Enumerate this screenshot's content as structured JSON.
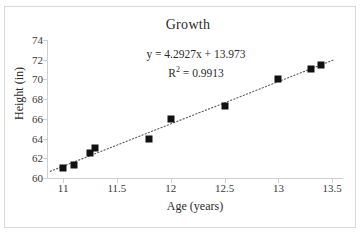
{
  "chart_data": {
    "type": "scatter",
    "title": "Growth",
    "xlabel": "Age (years)",
    "ylabel": "Height (in)",
    "xlim": [
      10.85,
      13.6
    ],
    "ylim": [
      60,
      74
    ],
    "xticks": [
      "11",
      "11.5",
      "12",
      "12.5",
      "13",
      "13.5"
    ],
    "xtick_values": [
      11,
      11.5,
      12,
      12.5,
      13,
      13.5
    ],
    "yticks": [
      "60",
      "62",
      "64",
      "66",
      "68",
      "70",
      "72",
      "74"
    ],
    "ytick_values": [
      60,
      62,
      64,
      66,
      68,
      70,
      72,
      74
    ],
    "grid": false,
    "legend": "none",
    "marker_color": "#111111",
    "trendline_color": "#5a5a5a",
    "trendline_style": "dotted",
    "x": [
      11,
      11.1,
      11.25,
      11.3,
      11.8,
      12,
      12.5,
      13,
      13.3,
      13.4
    ],
    "y": [
      61,
      61.3,
      62.5,
      63,
      64,
      66,
      67.3,
      70,
      71.1,
      71.5
    ],
    "points": [
      {
        "x": 11,
        "y": 61
      },
      {
        "x": 11.1,
        "y": 61.3
      },
      {
        "x": 11.25,
        "y": 62.5
      },
      {
        "x": 11.3,
        "y": 63
      },
      {
        "x": 11.8,
        "y": 64
      },
      {
        "x": 12,
        "y": 66
      },
      {
        "x": 12.5,
        "y": 67.3
      },
      {
        "x": 13,
        "y": 70
      },
      {
        "x": 13.3,
        "y": 71.1
      },
      {
        "x": 13.4,
        "y": 71.5
      }
    ],
    "annotations": {
      "equation": "y = 4.2927x + 13.973",
      "r_squared_label": "R",
      "r_squared_exponent": "2",
      "r_squared_value": " = 0.9913",
      "r_squared_full": "R² = 0.9913"
    },
    "trendline": {
      "slope": 4.2927,
      "intercept": 13.973,
      "r_squared": 0.9913
    }
  }
}
